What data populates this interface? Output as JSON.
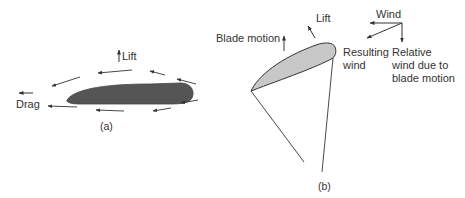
{
  "figure": {
    "panel_a": {
      "caption": "(a)",
      "labels": {
        "lift": "Lift",
        "drag": "Drag"
      },
      "airfoil_color": "#555555"
    },
    "panel_b": {
      "caption": "(b)",
      "labels": {
        "lift": "Lift",
        "blade_motion": "Blade motion",
        "wind": "Wind",
        "resulting_wind_1": "Resulting",
        "resulting_wind_2": "wind",
        "relative_wind_1": "Relative",
        "relative_wind_2": "wind due to",
        "relative_wind_3": "blade motion"
      },
      "airfoil_color": "#c8c8c8"
    },
    "line_color": "#333333"
  }
}
